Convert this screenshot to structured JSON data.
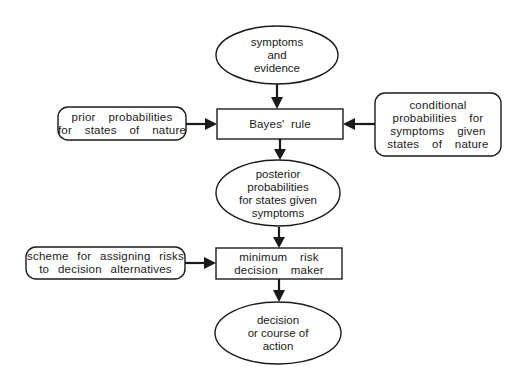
{
  "diagram": {
    "title": "",
    "nodes": {
      "symptoms": {
        "shape": "ellipse",
        "lines": [
          "symptoms",
          "and",
          "evidence"
        ]
      },
      "bayes": {
        "shape": "rectangle",
        "lines": [
          "Bayes' rule"
        ]
      },
      "prior": {
        "shape": "rounded-rectangle",
        "lines": [
          "prior  probabilities",
          "for  states  of  nature"
        ]
      },
      "conditional": {
        "shape": "rounded-rectangle",
        "lines": [
          "conditional",
          "probabilities  for",
          "symptoms  given",
          "states  of  nature"
        ]
      },
      "posterior": {
        "shape": "ellipse",
        "lines": [
          "posterior",
          "probabilities",
          "for states given",
          "symptoms"
        ]
      },
      "scheme": {
        "shape": "rounded-rectangle",
        "lines": [
          "scheme  for  assigning  risks",
          "to  decision  alternatives"
        ]
      },
      "minrisk": {
        "shape": "rectangle",
        "lines": [
          "minimum  risk",
          "decision  maker"
        ]
      },
      "decision": {
        "shape": "ellipse",
        "lines": [
          "decision",
          "or course of",
          "action"
        ]
      }
    },
    "edges": [
      {
        "from": "symptoms",
        "to": "bayes"
      },
      {
        "from": "prior",
        "to": "bayes"
      },
      {
        "from": "conditional",
        "to": "bayes"
      },
      {
        "from": "bayes",
        "to": "posterior"
      },
      {
        "from": "posterior",
        "to": "minrisk"
      },
      {
        "from": "scheme",
        "to": "minrisk"
      },
      {
        "from": "minrisk",
        "to": "decision"
      }
    ]
  }
}
